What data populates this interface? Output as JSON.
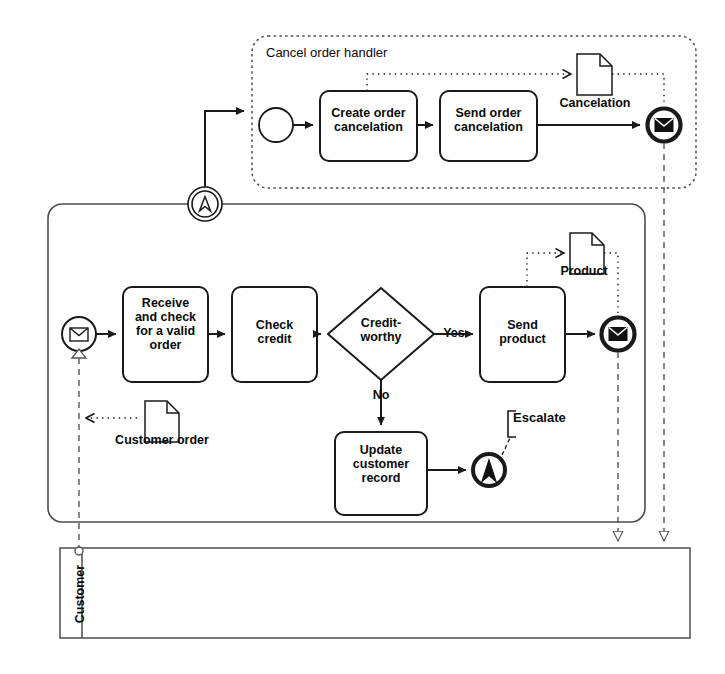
{
  "diagram": {
    "type": "bpmn-collaboration",
    "stroke_color": "#1a1a1a",
    "fill_color": "#ffffff",
    "text_color": "#0a0a0a"
  },
  "subprocess": {
    "name": "cancel-order-handler",
    "title": "Cancel order handler",
    "start_event": {
      "name": "cancel-start-event",
      "type": "start",
      "label": ""
    },
    "tasks": [
      {
        "name": "create-order-cancelation",
        "label": "Create order\ncancelation"
      },
      {
        "name": "send-order-cancelation",
        "label": "Send order\ncancelation"
      }
    ],
    "data_object": {
      "name": "cancelation-data-object",
      "label": "Cancelation"
    },
    "end_event": {
      "name": "cancel-message-end-event",
      "type": "message-end",
      "label": ""
    }
  },
  "main_process": {
    "name": "order-handling-process",
    "title": "",
    "start_event": {
      "name": "order-received-start-event",
      "type": "message-start",
      "label": ""
    },
    "boundary_event": {
      "name": "escalation-boundary-event",
      "type": "escalation-catch",
      "label": ""
    },
    "tasks": [
      {
        "name": "receive-and-check-order-task",
        "label": "Receive\nand check\nfor a valid\norder"
      },
      {
        "name": "check-credit-task",
        "label": "Check\ncredit"
      },
      {
        "name": "send-product-task",
        "label": "Send\nproduct"
      },
      {
        "name": "update-customer-record-task",
        "label": "Update\ncustomer\nrecord"
      }
    ],
    "gateway": {
      "name": "credit-worthy-gateway",
      "type": "exclusive",
      "label": "Credit-\nworthy"
    },
    "flow_labels": [
      {
        "name": "flow-label-yes",
        "label": "Yes"
      },
      {
        "name": "flow-label-no",
        "label": "No"
      }
    ],
    "data_objects": [
      {
        "name": "customer-order-data-object",
        "label": "Customer order"
      },
      {
        "name": "product-data-object",
        "label": "Product"
      }
    ],
    "end_events": [
      {
        "name": "escalation-end-event",
        "type": "escalation-throw",
        "label": ""
      },
      {
        "name": "product-message-end-event",
        "type": "message-end",
        "label": ""
      }
    ],
    "annotation": {
      "name": "escalate-annotation",
      "label": "Escalate"
    }
  },
  "customer_pool": {
    "name": "customer-pool",
    "label": "Customer"
  }
}
